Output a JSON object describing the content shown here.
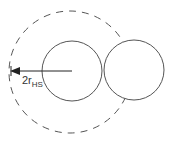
{
  "diagram": {
    "label_main": "2r",
    "label_sub": "HS",
    "colors": {
      "stroke": "#555555",
      "arrow": "#222222",
      "text": "#333333",
      "background": "#ffffff"
    },
    "shapes": {
      "dashed_circle": {
        "cx": 70,
        "cy": 72,
        "r": 61
      },
      "left_circle": {
        "cx": 72,
        "cy": 71,
        "r": 30
      },
      "right_circle": {
        "cx": 134,
        "cy": 70,
        "r": 30
      },
      "arrow": {
        "x1": 72,
        "y1": 71,
        "x2": 11,
        "y2": 71
      }
    }
  }
}
